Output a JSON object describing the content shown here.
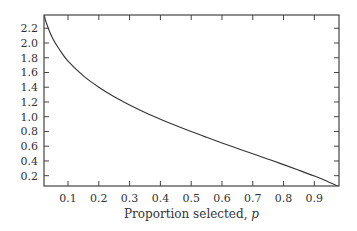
{
  "chart_data": {
    "type": "line",
    "title": "",
    "xlabel": "Proportion selected, p",
    "xlabel_text": "Proportion selected, ",
    "xlabel_var": "p",
    "ylabel": "",
    "xlim": [
      0.022,
      0.98
    ],
    "ylim": [
      0.06,
      2.38
    ],
    "x_ticks": [
      0.1,
      0.2,
      0.3,
      0.4,
      0.5,
      0.6,
      0.7,
      0.8,
      0.9
    ],
    "x_tick_labels": [
      "0.1",
      "0.2",
      "0.3",
      "0.4",
      "0.5",
      "0.6",
      "0.7",
      "0.8",
      "0.9"
    ],
    "y_ticks": [
      0.2,
      0.4,
      0.6,
      0.8,
      1.0,
      1.2,
      1.4,
      1.6,
      1.8,
      2.0,
      2.2
    ],
    "y_tick_labels": [
      "0.2",
      "0.4",
      "0.6",
      "0.8",
      "1.0",
      "1.2",
      "1.4",
      "1.6",
      "1.8",
      "2.0",
      "2.2"
    ],
    "grid": false,
    "legend": null,
    "series": [
      {
        "name": "selection intensity",
        "x": [
          0.02,
          0.03,
          0.05,
          0.075,
          0.1,
          0.15,
          0.2,
          0.25,
          0.3,
          0.35,
          0.4,
          0.45,
          0.5,
          0.55,
          0.6,
          0.65,
          0.7,
          0.75,
          0.8,
          0.85,
          0.9,
          0.95,
          0.98
        ],
        "y": [
          2.421,
          2.268,
          2.063,
          1.893,
          1.755,
          1.554,
          1.4,
          1.271,
          1.159,
          1.058,
          0.966,
          0.88,
          0.798,
          0.72,
          0.644,
          0.57,
          0.497,
          0.424,
          0.35,
          0.274,
          0.195,
          0.109,
          0.049
        ]
      }
    ],
    "colors": {
      "line": "#333333",
      "frame": "#444444",
      "background": "#ffffff"
    }
  }
}
